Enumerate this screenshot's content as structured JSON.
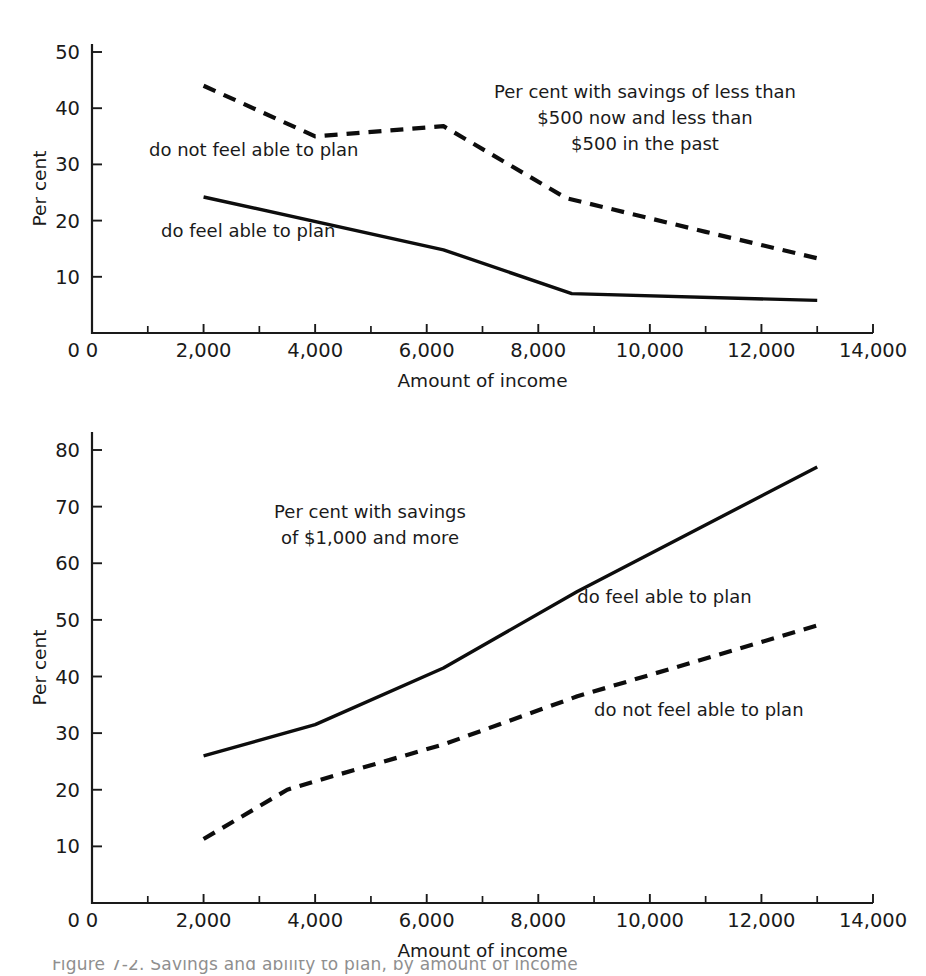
{
  "figure": {
    "background": "#ffffff",
    "ink_color": "#111111",
    "caption_partial": "Figure 7-2. Savings and ability to plan, by amount of income"
  },
  "chart_data": [
    {
      "id": "top",
      "type": "line",
      "title": "Per cent with savings of less than $500 now and less than $500 in the past",
      "title_lines": [
        "Per cent with savings of less than",
        "$500 now and less than",
        "$500 in the past"
      ],
      "xlabel": "Amount of income",
      "ylabel": "Per cent",
      "xlim": [
        0,
        14000
      ],
      "ylim": [
        0,
        52
      ],
      "grid": false,
      "legend": "inline-annotations",
      "xticks": [
        0,
        2000,
        4000,
        6000,
        8000,
        10000,
        12000,
        14000
      ],
      "xticklabels": [
        "0",
        "2,000",
        "4,000",
        "6,000",
        "8,000",
        "10,000",
        "12,000",
        "14,000"
      ],
      "xminorticks": [
        1000,
        3000,
        5000,
        7000,
        9000,
        11000,
        13000
      ],
      "yticks": [
        10,
        20,
        30,
        40,
        50
      ],
      "yticklabels": [
        "10",
        "20",
        "30",
        "40",
        "50"
      ],
      "yzero_label": "0",
      "series": [
        {
          "name": "do not feel able to plan",
          "style": "dashed",
          "label_x": 2900,
          "label_y": 31.5,
          "x": [
            2000,
            4000,
            6300,
            8500,
            11000,
            13000
          ],
          "values": [
            44.0,
            35.0,
            36.8,
            24.0,
            18.0,
            13.3
          ]
        },
        {
          "name": "do feel able to plan",
          "style": "solid",
          "label_x": 2800,
          "label_y": 17.0,
          "x": [
            2000,
            6300,
            8600,
            13000
          ],
          "values": [
            24.2,
            14.8,
            7.0,
            5.8
          ]
        }
      ]
    },
    {
      "id": "bottom",
      "type": "line",
      "title": "Per cent with savings of $1,000 and more",
      "title_lines": [
        "Per cent with savings",
        "of $1,000 and more"
      ],
      "xlabel": "Amount of income",
      "ylabel": "Per cent",
      "xlim": [
        0,
        14000
      ],
      "ylim": [
        0,
        86
      ],
      "grid": false,
      "legend": "inline-annotations",
      "xticks": [
        0,
        2000,
        4000,
        6000,
        8000,
        10000,
        12000,
        14000
      ],
      "xticklabels": [
        "0",
        "2,000",
        "4,000",
        "6,000",
        "8,000",
        "10,000",
        "12,000",
        "14,000"
      ],
      "xminorticks": [
        1000,
        3000,
        5000,
        7000,
        9000,
        11000,
        13000
      ],
      "yticks": [
        10,
        20,
        30,
        40,
        50,
        60,
        70,
        80
      ],
      "yticklabels": [
        "10",
        "20",
        "30",
        "40",
        "50",
        "60",
        "70",
        "80"
      ],
      "yzero_label": "0",
      "series": [
        {
          "name": "do feel able to plan",
          "style": "solid",
          "label_x": 8700,
          "label_y": 53.0,
          "x": [
            2000,
            4000,
            6300,
            8700,
            13000
          ],
          "values": [
            26.0,
            31.5,
            41.5,
            55.0,
            77.0
          ]
        },
        {
          "name": "do not feel able to plan",
          "style": "dashed",
          "label_x": 9000,
          "label_y": 33.0,
          "x": [
            2000,
            3500,
            4000,
            6300,
            8700,
            13000
          ],
          "values": [
            11.3,
            20.0,
            21.5,
            28.0,
            36.5,
            49.0
          ]
        }
      ]
    }
  ]
}
